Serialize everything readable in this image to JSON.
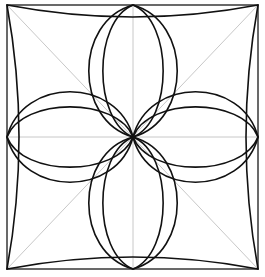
{
  "diagram": {
    "type": "geometric-pattern",
    "colors": {
      "background": "#ffffff",
      "outline": "#111111",
      "guides": "#c8c8c8"
    },
    "square": {
      "left": 7,
      "top": 5,
      "right": 258,
      "bottom": 269
    },
    "center": {
      "x": 133,
      "y": 137
    },
    "guides": [
      "diagonal-tl-br",
      "diagonal-tr-bl",
      "vertical-midline",
      "horizontal-midline"
    ],
    "petals": [
      {
        "name": "top",
        "outer_half_width": 44,
        "inner_half_width": 30
      },
      {
        "name": "bottom",
        "outer_half_width": 44,
        "inner_half_width": 30
      },
      {
        "name": "left",
        "outer_half_width": 45,
        "inner_half_width": 30
      },
      {
        "name": "right",
        "outer_half_width": 45,
        "inner_half_width": 30
      }
    ],
    "edge_inset": 12
  }
}
